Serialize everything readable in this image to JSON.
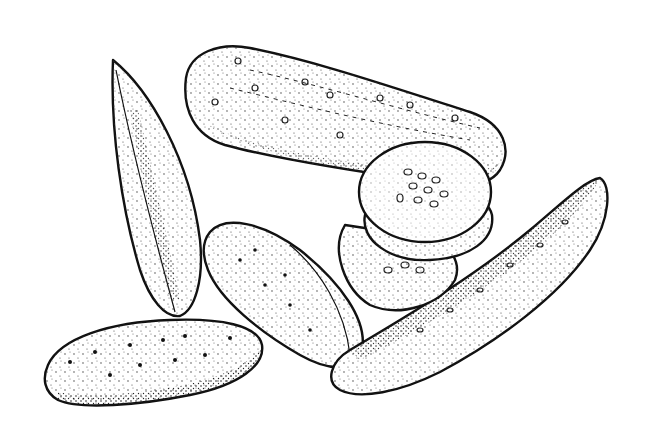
{
  "image": {
    "subject": "Pen-and-ink stippled illustration of pickles",
    "style": "black-and-white stipple drawing",
    "background_color": "#ffffff",
    "ink_color": "#111111",
    "objects": [
      {
        "name": "whole-pickle-top",
        "description": "Large whole pickle lying diagonally across the top"
      },
      {
        "name": "pickle-spear-left",
        "description": "Tall narrow pickle spear on the left"
      },
      {
        "name": "pickle-slices",
        "description": "Stack of three round pickle slices showing seeds"
      },
      {
        "name": "pickle-half-center",
        "description": "Oval pickle half in the center"
      },
      {
        "name": "pickle-spear-right",
        "description": "Long pickle spear on the right angled upward"
      },
      {
        "name": "pickle-half-bottom-left",
        "description": "Oval pickle half at the bottom left"
      }
    ]
  }
}
